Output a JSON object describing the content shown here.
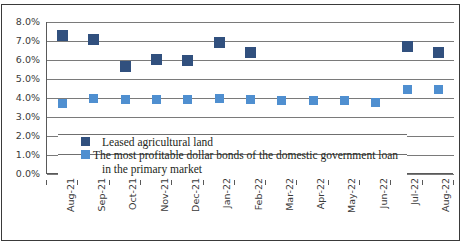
{
  "chart_data": {
    "type": "scatter",
    "title": "",
    "xlabel": "",
    "ylabel": "",
    "ylim": [
      0.0,
      8.0
    ],
    "ytick_labels": [
      "8.0%",
      "7.0%",
      "6.0%",
      "5.0%",
      "4.0%",
      "3.0%",
      "2.0%",
      "1.0%",
      "0.0%"
    ],
    "ytick_values": [
      8.0,
      7.0,
      6.0,
      5.0,
      4.0,
      3.0,
      2.0,
      1.0,
      0.0
    ],
    "grid": "horizontal",
    "legend_position": "inside-lower-left",
    "categories": [
      "Aug-21",
      "Sep-21",
      "Oct-21",
      "Nov-21",
      "Dec-21",
      "Jan-22",
      "Feb-22",
      "Mar-22",
      "Apr-22",
      "May-22",
      "Jun-22",
      "Jul-22",
      "Aug-22"
    ],
    "series": [
      {
        "name": "Leased agricultural land",
        "color": "#31507e",
        "values": [
          7.3,
          7.1,
          5.65,
          6.05,
          6.0,
          6.9,
          6.4,
          null,
          null,
          null,
          null,
          6.7,
          6.4
        ]
      },
      {
        "name": "The most profitable dollar bonds of the domestic government loan in the primary market",
        "color": "#4f8fd0",
        "values": [
          3.7,
          3.95,
          3.9,
          3.9,
          3.9,
          3.95,
          3.9,
          3.85,
          3.85,
          3.85,
          3.75,
          4.45,
          4.45
        ]
      }
    ]
  },
  "legend": {
    "line1": "Leased agricultural land",
    "line2": "The most profitable dollar bonds of the domestic government loan",
    "line3": "in the primary market"
  }
}
